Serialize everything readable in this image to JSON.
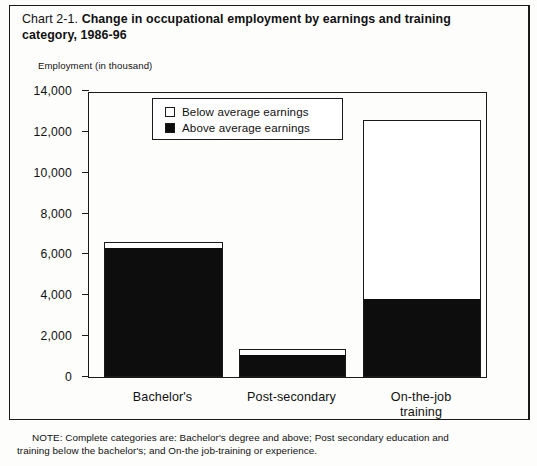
{
  "figure": {
    "chart_number": "Chart  2-1.",
    "title": "Change in occupational employment by earnings and training category, 1986-96",
    "note_line1": "NOTE: Complete categories are: Bachelor's degree and above; Post secondary education and",
    "note_line2": "training below the bachelor's; and On-the job-training or experience."
  },
  "chart_data": {
    "type": "bar",
    "stacked": true,
    "title": "Change in occupational employment by earnings and training category, 1986-96",
    "xlabel": "",
    "ylabel": "Employment (in thousand)",
    "categories": [
      "Bachelor's",
      "Post-secondary",
      "On-the-job training"
    ],
    "category_lines": [
      [
        "Bachelor's"
      ],
      [
        "Post-secondary"
      ],
      [
        "On-the-job",
        "training"
      ]
    ],
    "series": [
      {
        "name": "Above average earnings",
        "color": "#0d0d0d",
        "values": [
          6350,
          1080,
          3850
        ]
      },
      {
        "name": "Below average earnings",
        "color": "#ffffff",
        "values": [
          250,
          300,
          8750
        ]
      }
    ],
    "totals": [
      6600,
      1380,
      12600
    ],
    "ylim": [
      0,
      14000
    ],
    "yticks": [
      0,
      2000,
      4000,
      6000,
      8000,
      10000,
      12000,
      14000
    ],
    "ytick_labels": [
      "0",
      "2,000",
      "4,000",
      "6,000",
      "8,000",
      "10,000",
      "12,000",
      "14,000"
    ],
    "grid": false,
    "legend_position": "upper-left-inside",
    "legend_entries": [
      {
        "label": "Below average earnings",
        "swatch": "hollow"
      },
      {
        "label": "Above average earnings",
        "swatch": "filled"
      }
    ]
  }
}
